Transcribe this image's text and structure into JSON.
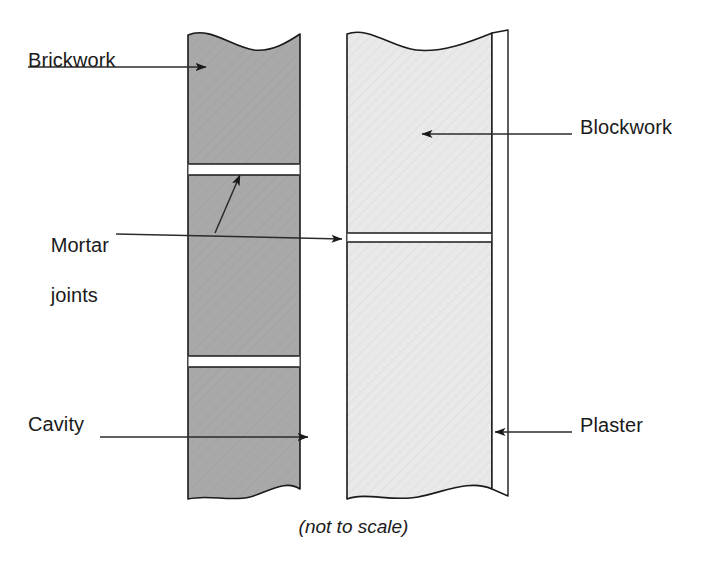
{
  "figure": {
    "caption": "(not to scale)"
  },
  "labels": {
    "brickwork": "Brickwork",
    "mortar_joints_line1": "Mortar",
    "mortar_joints_line2": "joints",
    "cavity": "Cavity",
    "blockwork": "Blockwork",
    "plaster": "Plaster"
  },
  "colors": {
    "brickwork_fill": "#a9a9a9",
    "blockwork_fill": "#e9e9e9",
    "plaster_fill": "#ffffff",
    "mortar_fill": "#ffffff",
    "outline": "#1a1a1a",
    "leader_line": "#2b2b2b",
    "background": "#ffffff",
    "text": "#1a1a1a"
  },
  "components": [
    {
      "name": "brickwork",
      "label": "Brickwork",
      "fill": "#a9a9a9",
      "x_left": 188,
      "x_right": 300,
      "y_top": 30,
      "y_bottom": 500,
      "mortar_joint_rows": [
        165,
        358
      ]
    },
    {
      "name": "cavity",
      "label": "Cavity",
      "fill": "#ffffff",
      "x_left": 300,
      "x_right": 347,
      "y_top": 30,
      "y_bottom": 500
    },
    {
      "name": "blockwork",
      "label": "Blockwork",
      "fill": "#e9e9e9",
      "x_left": 347,
      "x_right": 492,
      "y_top": 30,
      "y_bottom": 500,
      "mortar_joint_rows": [
        238
      ]
    },
    {
      "name": "plaster",
      "label": "Plaster",
      "fill": "#ffffff",
      "x_left": 492,
      "x_right": 508,
      "y_top": 30,
      "y_bottom": 500
    }
  ],
  "leaders": [
    {
      "name": "brickwork-leader",
      "from_x": 28,
      "from_y": 67,
      "to_x": 216,
      "to_y": 67,
      "arrow": "right"
    },
    {
      "name": "mortar-leader",
      "from_x": 115,
      "from_y": 237,
      "to_x": 352,
      "to_y": 237,
      "arrow": "right"
    },
    {
      "name": "mortar-branch",
      "from_x": 218,
      "from_y": 232,
      "to_x": 243,
      "to_y": 170,
      "arrow": "up-right"
    },
    {
      "name": "cavity-leader",
      "from_x": 100,
      "from_y": 437,
      "to_x": 318,
      "to_y": 437,
      "arrow": "right"
    },
    {
      "name": "blockwork-leader",
      "from_x": 570,
      "from_y": 134,
      "to_x": 432,
      "to_y": 134,
      "arrow": "left"
    },
    {
      "name": "plaster-leader",
      "from_x": 570,
      "from_y": 432,
      "to_x": 500,
      "to_y": 432,
      "arrow": "left"
    }
  ]
}
